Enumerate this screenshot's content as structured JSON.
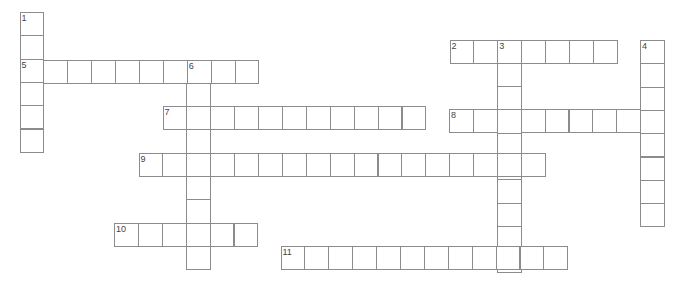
{
  "puzzle": {
    "type": "crossword",
    "cell_width": 23.9,
    "cell_height": 23.3,
    "words": [
      {
        "number": "1",
        "direction": "down",
        "x": 19.5,
        "y": 12,
        "length": 6
      },
      {
        "number": "2",
        "direction": "across",
        "x": 449.5,
        "y": 39.5,
        "length": 7
      },
      {
        "number": "3",
        "direction": "down",
        "x": 497.3,
        "y": 39.5,
        "length": 10
      },
      {
        "number": "4",
        "direction": "down",
        "x": 640,
        "y": 40,
        "length": 8
      },
      {
        "number": "5",
        "direction": "across",
        "x": 19.5,
        "y": 59.5,
        "length": 10
      },
      {
        "number": "6",
        "direction": "down",
        "x": 186,
        "y": 59.5,
        "length": 9
      },
      {
        "number": "7",
        "direction": "across",
        "x": 162.5,
        "y": 106,
        "length": 11
      },
      {
        "number": "8",
        "direction": "across",
        "x": 449,
        "y": 109,
        "length": 9
      },
      {
        "number": "9",
        "direction": "across",
        "x": 138.5,
        "y": 152.5,
        "length": 17
      },
      {
        "number": "10",
        "direction": "across",
        "x": 114,
        "y": 222.7,
        "length": 6
      },
      {
        "number": "11",
        "direction": "across",
        "x": 280.5,
        "y": 246,
        "length": 12
      }
    ]
  }
}
